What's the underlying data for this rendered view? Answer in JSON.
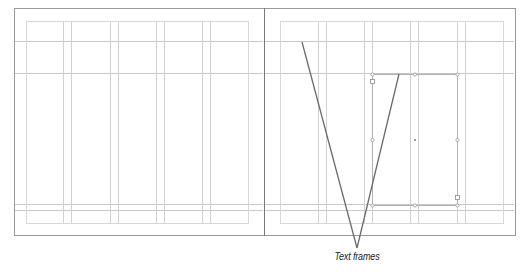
{
  "annotation": {
    "label": "Text frames"
  },
  "colors": {
    "page_edge": "#9a9a9a",
    "margin_guide": "#d8d8d8",
    "column_guide": "#d0d0d0",
    "baseline_guide": "#c8c8c8",
    "frame": "#b0b0b0",
    "pointer": "#6b6b6b"
  },
  "spread": {
    "pages": [
      {
        "name": "left-page",
        "edge": {
          "x": 14,
          "y": 8,
          "w": 250,
          "h": 227
        },
        "margin": {
          "x": 26,
          "y": 21,
          "w": 222,
          "h": 202
        },
        "columns_x": [
          63,
          71,
          110,
          118,
          156,
          164,
          202,
          210
        ],
        "guides_y": [
          41,
          73,
          204,
          210
        ]
      },
      {
        "name": "right-page",
        "edge": {
          "x": 264,
          "y": 8,
          "w": 251,
          "h": 227
        },
        "margin": {
          "x": 280,
          "y": 21,
          "w": 223,
          "h": 202
        },
        "columns_x": [
          318,
          326,
          364,
          372,
          410,
          418,
          457,
          465
        ],
        "guides_y": [
          41,
          73,
          204,
          210
        ]
      }
    ],
    "text_frame": {
      "x": 372,
      "y": 74,
      "w": 85,
      "h": 131
    }
  },
  "pointers": [
    {
      "from": [
        302,
        42
      ],
      "to": [
        357,
        248
      ]
    },
    {
      "from": [
        399,
        74
      ],
      "to": [
        357,
        248
      ]
    }
  ]
}
